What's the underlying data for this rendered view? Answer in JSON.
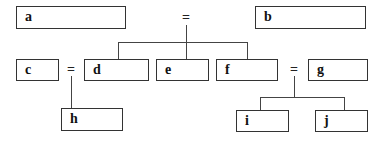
{
  "diagram": {
    "type": "tree-equivalence",
    "nodes": {
      "a": "a",
      "b": "b",
      "c": "c",
      "d": "d",
      "e": "e",
      "f": "f",
      "g": "g",
      "h": "h",
      "i": "i",
      "j": "j"
    },
    "operators": {
      "top": "=",
      "left": "=",
      "right": "="
    },
    "relations": [
      {
        "left": "a",
        "op": "=",
        "right": "b",
        "children": [
          "d",
          "e",
          "f"
        ]
      },
      {
        "left": "c",
        "op": "=",
        "right": "d",
        "children": [
          "h"
        ]
      },
      {
        "left": "f",
        "op": "=",
        "right": "g",
        "children": [
          "i",
          "j"
        ]
      }
    ]
  }
}
